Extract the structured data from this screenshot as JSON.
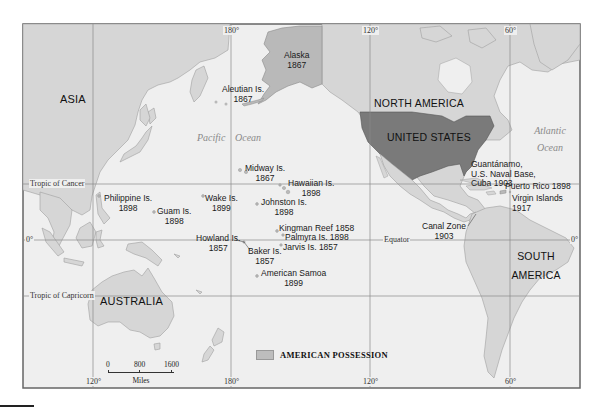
{
  "map": {
    "colors": {
      "ocean": "#efefef",
      "land": "#d6d6d6",
      "possession": "#b9b9b9",
      "united_states": "#7a7a7a",
      "frame": "#666666",
      "grid": "#8a8a8a"
    },
    "continents": {
      "asia": "ASIA",
      "australia": "AUSTRALIA",
      "north_america": "NORTH AMERICA",
      "united_states": "UNITED STATES",
      "south_america_line1": "SOUTH",
      "south_america_line2": "AMERICA"
    },
    "oceans": {
      "pacific_1": "Pacific",
      "pacific_2": "Ocean",
      "atlantic_1": "Atlantic",
      "atlantic_2": "Ocean"
    },
    "graticule": {
      "top_180": "180°",
      "top_120w": "120°",
      "top_60w": "60°",
      "bottom_120e": "120°",
      "bottom_180": "180°",
      "bottom_120w": "120°",
      "bottom_60w": "60°",
      "tropic_cancer": "Tropic of Cancer",
      "tropic_capricorn": "Tropic of Capricorn",
      "equator": "Equator",
      "zero_left": "0°",
      "zero_right": "0°"
    },
    "possessions": [
      {
        "name": "Alaska",
        "year": "1867"
      },
      {
        "name": "Aleutian Is.",
        "year": "1867"
      },
      {
        "name": "Midway Is.",
        "year": "1867"
      },
      {
        "name": "Hawaiian Is.",
        "year": "1898"
      },
      {
        "name": "Johnston Is.",
        "year": "1898"
      },
      {
        "name": "Wake Is.",
        "year": "1899"
      },
      {
        "name": "Philippine Is.",
        "year": "1898"
      },
      {
        "name": "Guam Is.",
        "year": "1898"
      },
      {
        "name": "Howland Is.",
        "year": "1857"
      },
      {
        "name": "Baker Is.",
        "year": "1857"
      },
      {
        "name": "Kingman Reef 1858"
      },
      {
        "name": "Palmyra Is. 1898"
      },
      {
        "name": "Jarvis Is. 1857"
      },
      {
        "name": "American Samoa",
        "year": "1899"
      },
      {
        "name": "Canal Zone",
        "year": "1903"
      },
      {
        "name": "Guantánamo,",
        "line2": "U.S. Naval Base,",
        "line3": "Cuba 1903"
      },
      {
        "name": "Puerto Rico 1898"
      },
      {
        "name": "Virgin Islands",
        "year": "1917"
      }
    ],
    "legend": {
      "label": "AMERICAN POSSESSION"
    },
    "scale": {
      "ticks": [
        "0",
        "800",
        "1600"
      ],
      "unit": "Miles"
    }
  }
}
